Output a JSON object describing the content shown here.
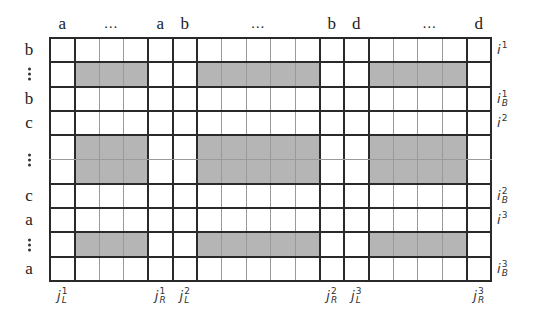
{
  "diagram": {
    "type": "block-matrix",
    "shade_color": "#b5b5b5",
    "line_color": "#2a2a2a",
    "thin_line_color": "#9a9a9a",
    "grid": {
      "rows": 10,
      "cols": 18
    },
    "column_labels": [
      {
        "text": "a",
        "col": 0
      },
      {
        "text": "...",
        "col": 2
      },
      {
        "text": "a",
        "col": 4
      },
      {
        "text": "b",
        "col": 5
      },
      {
        "text": "...",
        "col": 8
      },
      {
        "text": "b",
        "col": 11
      },
      {
        "text": "d",
        "col": 12
      },
      {
        "text": "...",
        "col": 15
      },
      {
        "text": "d",
        "col": 17
      }
    ],
    "row_labels": [
      {
        "text": "b",
        "row": 0
      },
      {
        "text": "⋮",
        "row": 1
      },
      {
        "text": "b",
        "row": 2
      },
      {
        "text": "c",
        "row": 3
      },
      {
        "text": "⋮",
        "row": 4.5
      },
      {
        "text": "c",
        "row": 6
      },
      {
        "text": "a",
        "row": 7
      },
      {
        "text": "⋮",
        "row": 8
      },
      {
        "text": "a",
        "row": 9
      }
    ],
    "right_labels": [
      {
        "base": "i",
        "sup": "1",
        "sub": "",
        "row": 0
      },
      {
        "base": "i",
        "sup": "1",
        "sub": "B",
        "row": 2
      },
      {
        "base": "i",
        "sup": "2",
        "sub": "",
        "row": 3
      },
      {
        "base": "i",
        "sup": "2",
        "sub": "B",
        "row": 6
      },
      {
        "base": "i",
        "sup": "3",
        "sub": "",
        "row": 7
      },
      {
        "base": "i",
        "sup": "3",
        "sub": "B",
        "row": 9
      }
    ],
    "bottom_labels": [
      {
        "base": "j",
        "sup": "1",
        "sub": "L",
        "col": 0
      },
      {
        "base": "j",
        "sup": "1",
        "sub": "R",
        "col": 4
      },
      {
        "base": "j",
        "sup": "2",
        "sub": "L",
        "col": 5
      },
      {
        "base": "j",
        "sup": "2",
        "sub": "R",
        "col": 11
      },
      {
        "base": "j",
        "sup": "3",
        "sub": "L",
        "col": 12
      },
      {
        "base": "j",
        "sup": "3",
        "sub": "R",
        "col": 17
      }
    ],
    "shaded_blocks": [
      {
        "rows": [
          1,
          1
        ],
        "cols": [
          1,
          3
        ]
      },
      {
        "rows": [
          1,
          1
        ],
        "cols": [
          6,
          10
        ]
      },
      {
        "rows": [
          1,
          1
        ],
        "cols": [
          13,
          16
        ]
      },
      {
        "rows": [
          4,
          5
        ],
        "cols": [
          1,
          3
        ]
      },
      {
        "rows": [
          4,
          5
        ],
        "cols": [
          6,
          10
        ]
      },
      {
        "rows": [
          4,
          5
        ],
        "cols": [
          13,
          16
        ]
      },
      {
        "rows": [
          8,
          8
        ],
        "cols": [
          1,
          3
        ]
      },
      {
        "rows": [
          8,
          8
        ],
        "cols": [
          6,
          10
        ]
      },
      {
        "rows": [
          8,
          8
        ],
        "cols": [
          13,
          16
        ]
      }
    ],
    "thick_col_boundaries": [
      0,
      1,
      4,
      5,
      6,
      11,
      12,
      13,
      17,
      18
    ],
    "thick_row_boundaries": [
      0,
      1,
      2,
      3,
      4,
      6,
      7,
      8,
      9,
      10
    ]
  }
}
